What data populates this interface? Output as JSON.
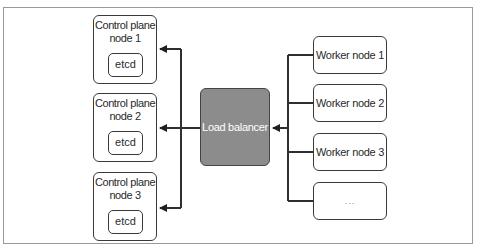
{
  "diagram": {
    "control_plane_nodes": [
      {
        "label_line1": "Control plane",
        "label_line2": "node 1",
        "component": "etcd"
      },
      {
        "label_line1": "Control plane",
        "label_line2": "node 2",
        "component": "etcd"
      },
      {
        "label_line1": "Control plane",
        "label_line2": "node 3",
        "component": "etcd"
      }
    ],
    "load_balancer": {
      "label": "Load balancer",
      "fill_color": "#8c8c8c",
      "text_color": "#ffffff"
    },
    "worker_nodes": [
      {
        "label": "Worker node 1"
      },
      {
        "label": "Worker node 2"
      },
      {
        "label": "Worker node 3"
      },
      {
        "label": "..."
      }
    ],
    "connections": [
      {
        "from": "worker_nodes",
        "to": "load_balancer",
        "arrow": "into load balancer"
      },
      {
        "from": "load_balancer",
        "to": "control_plane_nodes",
        "arrow": "into each control plane node"
      }
    ],
    "colors": {
      "stroke": "#2f2f2f",
      "frame": "#9a9a9a",
      "background": "#ffffff"
    }
  }
}
